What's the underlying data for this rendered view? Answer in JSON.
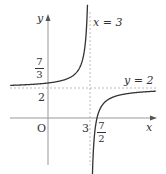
{
  "chart_data": {
    "type": "line",
    "title": "",
    "function": "y = 2 - 1/(x - 3)",
    "xlabel": "x",
    "ylabel": "y",
    "origin_label": "O",
    "asymptotes": {
      "vertical": {
        "x": 3,
        "label": "x = 3"
      },
      "horizontal": {
        "y": 2,
        "label": "y = 2"
      }
    },
    "x_ticks": [
      {
        "value": 3,
        "label": "3"
      },
      {
        "value": 3.5,
        "label": "7/2",
        "num": "7",
        "den": "2"
      }
    ],
    "y_ticks": [
      {
        "value": 2,
        "label": "2"
      },
      {
        "value": 2.3333,
        "label": "7/3",
        "num": "7",
        "den": "3"
      }
    ],
    "key_points": [
      {
        "x": 0,
        "y": 2.3333
      },
      {
        "x": 3.5,
        "y": 0
      }
    ],
    "xlim": [
      -3.2,
      7.6
    ],
    "ylim": [
      -4.1,
      7.2
    ],
    "grid": false,
    "colors": {
      "curve": "#333333",
      "axis": "#888888",
      "asymptote": "#aaaaaa"
    }
  }
}
